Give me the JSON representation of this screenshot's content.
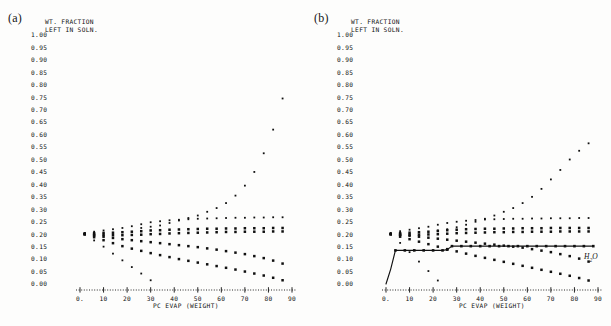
{
  "figure": {
    "background_color": "#fdfdfc",
    "ink_color": "#101010",
    "panels": [
      {
        "id": "a",
        "label": "(a)",
        "axis_title_line1": "WT. FRACTION",
        "axis_title_line2": "LEFT IN SOLN.",
        "xlabel": "PC EVAP (WEIGHT)",
        "series_label": "",
        "has_solid_curve": false
      },
      {
        "id": "b",
        "label": "(b)",
        "axis_title_line1": "WT. FRACTION",
        "axis_title_line2": "LEFT IN SOLN.",
        "xlabel": "PC EVAP (WEIGHT)",
        "series_label": "H2O",
        "has_solid_curve": true
      }
    ]
  },
  "chart_data": [
    {
      "type": "scatter",
      "panel": "a",
      "title": "",
      "subtitle": "",
      "xlabel": "PC EVAP (WEIGHT)",
      "ylabel": "WT. FRACTION LEFT IN SOLN.",
      "xlim": [
        0,
        90
      ],
      "ylim": [
        0.0,
        1.0
      ],
      "grid": false,
      "legend": "none",
      "xticks": [
        "0.",
        "10",
        "20",
        "30",
        "40",
        "50",
        "60",
        "70",
        "80",
        "90"
      ],
      "xtick_values": [
        0,
        10,
        20,
        30,
        40,
        50,
        60,
        70,
        80,
        90
      ],
      "yticks": [
        "1.00",
        "0.95",
        "0.90",
        "0.85",
        "0.80",
        "0.75",
        "0.70",
        "0.65",
        "0.60",
        "0.55",
        "0.50",
        "0.45",
        "0.40",
        "0.35",
        "0.30",
        "0.25",
        "0.20",
        "0.15",
        "0.10",
        "0.05",
        "0.00"
      ],
      "ytick_values": [
        1.0,
        0.95,
        0.9,
        0.85,
        0.8,
        0.75,
        0.7,
        0.65,
        0.6,
        0.55,
        0.5,
        0.45,
        0.4,
        0.35,
        0.3,
        0.25,
        0.2,
        0.15,
        0.1,
        0.05,
        0.0
      ],
      "series": [
        {
          "name": "rising-component",
          "marker": "dot",
          "x": [
            26,
            30,
            34,
            38,
            42,
            46,
            50,
            54,
            58,
            62,
            66,
            70,
            74,
            78,
            82,
            86
          ],
          "y": [
            0.225,
            0.23,
            0.235,
            0.245,
            0.255,
            0.265,
            0.275,
            0.29,
            0.305,
            0.325,
            0.355,
            0.395,
            0.45,
            0.525,
            0.62,
            0.745
          ]
        },
        {
          "name": "plateau-component-upper",
          "marker": "dot",
          "x": [
            2,
            6,
            10,
            14,
            18,
            22,
            26,
            30,
            34,
            38,
            42,
            46,
            50,
            54,
            58,
            62,
            66,
            70,
            74,
            78,
            82,
            86
          ],
          "y": [
            0.205,
            0.21,
            0.215,
            0.22,
            0.225,
            0.232,
            0.24,
            0.248,
            0.252,
            0.256,
            0.258,
            0.26,
            0.262,
            0.263,
            0.264,
            0.265,
            0.266,
            0.266,
            0.267,
            0.267,
            0.268,
            0.268
          ]
        },
        {
          "name": "plateau-component-mid",
          "marker": "square",
          "x": [
            2,
            6,
            10,
            14,
            18,
            22,
            26,
            30,
            34,
            38,
            42,
            46,
            50,
            54,
            58,
            62,
            66,
            70,
            74,
            78,
            82,
            86
          ],
          "y": [
            0.203,
            0.204,
            0.205,
            0.206,
            0.208,
            0.21,
            0.212,
            0.215,
            0.216,
            0.218,
            0.219,
            0.22,
            0.221,
            0.222,
            0.222,
            0.223,
            0.223,
            0.224,
            0.224,
            0.224,
            0.225,
            0.225
          ]
        },
        {
          "name": "plateau-component-low",
          "marker": "square",
          "x": [
            2,
            6,
            10,
            14,
            18,
            22,
            26,
            30,
            34,
            38,
            42,
            46,
            50,
            54,
            58,
            62,
            66,
            70,
            74,
            78,
            82,
            86
          ],
          "y": [
            0.2,
            0.198,
            0.197,
            0.196,
            0.196,
            0.197,
            0.198,
            0.2,
            0.201,
            0.203,
            0.204,
            0.205,
            0.206,
            0.207,
            0.208,
            0.209,
            0.209,
            0.21,
            0.21,
            0.21,
            0.211,
            0.211
          ]
        },
        {
          "name": "declining-component-a",
          "marker": "square",
          "x": [
            2,
            6,
            10,
            14,
            18,
            22,
            26,
            30,
            34,
            38,
            42,
            46,
            50,
            54,
            58,
            62,
            66,
            70,
            74,
            78,
            82,
            86
          ],
          "y": [
            0.2,
            0.195,
            0.19,
            0.185,
            0.18,
            0.176,
            0.172,
            0.168,
            0.164,
            0.16,
            0.156,
            0.152,
            0.148,
            0.143,
            0.138,
            0.132,
            0.126,
            0.12,
            0.112,
            0.104,
            0.094,
            0.082
          ]
        },
        {
          "name": "declining-component-b",
          "marker": "square",
          "x": [
            2,
            6,
            10,
            14,
            18,
            22,
            26,
            30,
            34,
            38,
            42,
            46,
            50,
            54,
            58,
            62,
            66,
            70,
            74,
            78,
            82,
            86
          ],
          "y": [
            0.2,
            0.188,
            0.176,
            0.164,
            0.152,
            0.142,
            0.133,
            0.124,
            0.116,
            0.108,
            0.1,
            0.093,
            0.086,
            0.079,
            0.072,
            0.065,
            0.058,
            0.05,
            0.042,
            0.034,
            0.025,
            0.015
          ]
        },
        {
          "name": "steep-decline-component",
          "marker": "dot",
          "x": [
            2,
            6,
            10,
            14,
            18,
            22,
            26,
            30
          ],
          "y": [
            0.2,
            0.175,
            0.15,
            0.122,
            0.095,
            0.068,
            0.042,
            0.015
          ]
        }
      ]
    },
    {
      "type": "scatter",
      "panel": "b",
      "title": "",
      "subtitle": "",
      "xlabel": "PC EVAP (WEIGHT)",
      "ylabel": "WT. FRACTION LEFT IN SOLN.",
      "xlim": [
        0,
        90
      ],
      "ylim": [
        0.0,
        1.0
      ],
      "grid": false,
      "legend": "inline-right",
      "xticks": [
        "0.",
        "10",
        "20",
        "30",
        "40",
        "50",
        "60",
        "70",
        "80",
        "90"
      ],
      "xtick_values": [
        0,
        10,
        20,
        30,
        40,
        50,
        60,
        70,
        80,
        90
      ],
      "yticks": [
        "1.00",
        "0.95",
        "0.90",
        "0.85",
        "0.80",
        "0.75",
        "0.70",
        "0.65",
        "0.60",
        "0.55",
        "0.50",
        "0.45",
        "0.40",
        "0.35",
        "0.30",
        "0.25",
        "0.20",
        "0.15",
        "0.10",
        "0.05",
        "0.00"
      ],
      "ytick_values": [
        1.0,
        0.95,
        0.9,
        0.85,
        0.8,
        0.75,
        0.7,
        0.65,
        0.6,
        0.55,
        0.5,
        0.45,
        0.4,
        0.35,
        0.3,
        0.25,
        0.2,
        0.15,
        0.1,
        0.05,
        0.0
      ],
      "series": [
        {
          "name": "water-curve",
          "marker": "line-with-dots",
          "x": [
            0,
            2,
            4,
            8,
            12,
            16,
            20,
            24,
            26,
            28,
            32,
            36,
            40,
            44,
            48,
            52,
            56,
            60,
            64,
            68,
            72,
            76,
            80,
            84,
            88
          ],
          "y": [
            0.0,
            0.06,
            0.135,
            0.135,
            0.135,
            0.135,
            0.135,
            0.135,
            0.138,
            0.152,
            0.152,
            0.152,
            0.152,
            0.152,
            0.152,
            0.152,
            0.152,
            0.152,
            0.152,
            0.152,
            0.152,
            0.152,
            0.152,
            0.152,
            0.152
          ]
        },
        {
          "name": "rising-component",
          "marker": "dot",
          "x": [
            22,
            26,
            30,
            34,
            38,
            42,
            46,
            50,
            54,
            58,
            62,
            66,
            70,
            74,
            78,
            82,
            86
          ],
          "y": [
            0.215,
            0.22,
            0.228,
            0.238,
            0.25,
            0.262,
            0.275,
            0.29,
            0.305,
            0.325,
            0.35,
            0.382,
            0.42,
            0.458,
            0.5,
            0.535,
            0.565
          ]
        },
        {
          "name": "plateau-component-upper",
          "marker": "dot",
          "x": [
            2,
            6,
            10,
            14,
            18,
            22,
            26,
            30,
            34,
            38,
            42,
            46,
            50,
            54,
            58,
            62,
            66,
            70,
            74,
            78,
            82,
            86
          ],
          "y": [
            0.205,
            0.212,
            0.218,
            0.224,
            0.23,
            0.238,
            0.245,
            0.25,
            0.254,
            0.257,
            0.259,
            0.26,
            0.261,
            0.262,
            0.262,
            0.263,
            0.263,
            0.264,
            0.264,
            0.264,
            0.265,
            0.265
          ]
        },
        {
          "name": "plateau-component-mid",
          "marker": "square",
          "x": [
            2,
            6,
            10,
            14,
            18,
            22,
            26,
            30,
            34,
            38,
            42,
            46,
            50,
            54,
            58,
            62,
            66,
            70,
            74,
            78,
            82,
            86
          ],
          "y": [
            0.202,
            0.204,
            0.206,
            0.208,
            0.21,
            0.213,
            0.216,
            0.218,
            0.22,
            0.221,
            0.222,
            0.222,
            0.223,
            0.223,
            0.224,
            0.224,
            0.224,
            0.225,
            0.225,
            0.225,
            0.225,
            0.225
          ]
        },
        {
          "name": "plateau-component-low",
          "marker": "square",
          "x": [
            2,
            6,
            10,
            14,
            18,
            22,
            26,
            30,
            34,
            38,
            42,
            46,
            50,
            54,
            58,
            62,
            66,
            70,
            74,
            78,
            82,
            86
          ],
          "y": [
            0.2,
            0.198,
            0.198,
            0.198,
            0.199,
            0.2,
            0.202,
            0.204,
            0.205,
            0.206,
            0.207,
            0.208,
            0.208,
            0.209,
            0.209,
            0.21,
            0.21,
            0.21,
            0.211,
            0.211,
            0.211,
            0.211
          ]
        },
        {
          "name": "declining-component-a",
          "marker": "square",
          "x": [
            2,
            6,
            10,
            14,
            18,
            22,
            26,
            30,
            34,
            38,
            42,
            46,
            50,
            54,
            58,
            62,
            66,
            70,
            74,
            78,
            82,
            86
          ],
          "y": [
            0.2,
            0.197,
            0.194,
            0.19,
            0.186,
            0.182,
            0.178,
            0.174,
            0.17,
            0.166,
            0.162,
            0.158,
            0.154,
            0.15,
            0.146,
            0.14,
            0.134,
            0.128,
            0.12,
            0.112,
            0.102,
            0.09
          ]
        },
        {
          "name": "declining-component-b",
          "marker": "square",
          "x": [
            2,
            6,
            10,
            14,
            18,
            22,
            26,
            30,
            34,
            38,
            42,
            46,
            50,
            54,
            58,
            62,
            66,
            70,
            74,
            78,
            82,
            86
          ],
          "y": [
            0.2,
            0.19,
            0.18,
            0.17,
            0.16,
            0.15,
            0.14,
            0.131,
            0.122,
            0.113,
            0.105,
            0.097,
            0.089,
            0.081,
            0.073,
            0.065,
            0.057,
            0.049,
            0.041,
            0.033,
            0.024,
            0.014
          ]
        },
        {
          "name": "steep-decline-component",
          "marker": "dot",
          "x": [
            2,
            6,
            10,
            14,
            18,
            22
          ],
          "y": [
            0.2,
            0.165,
            0.128,
            0.09,
            0.052,
            0.014
          ]
        }
      ]
    }
  ]
}
